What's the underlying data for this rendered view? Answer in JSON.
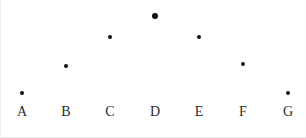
{
  "figure": {
    "width": 306,
    "height": 138,
    "background": "#ffffff",
    "marker_color": "#0d0d0d",
    "label_color": "#2b2b2b"
  },
  "chart_data": {
    "type": "scatter",
    "title": "",
    "subtitle": "",
    "xlabel": "",
    "ylabel": "",
    "categories": [
      "A",
      "B",
      "C",
      "D",
      "E",
      "F",
      "G"
    ],
    "values": [
      1,
      3,
      5,
      6,
      5,
      3,
      1
    ],
    "series": [
      {
        "name": "",
        "values": [
          1,
          3,
          5,
          6,
          5,
          3,
          1
        ]
      }
    ],
    "ylim": [
      0,
      6.5
    ],
    "xlim": [
      0,
      8
    ],
    "grid": false,
    "legend": false,
    "legend_position": "none",
    "annotations": [],
    "points": [
      {
        "label": "A",
        "value": 1,
        "x_px": 22,
        "y_px": 93,
        "size_px": 4
      },
      {
        "label": "B",
        "value": 3,
        "x_px": 66,
        "y_px": 66,
        "size_px": 4
      },
      {
        "label": "C",
        "value": 5,
        "x_px": 110,
        "y_px": 37,
        "size_px": 4
      },
      {
        "label": "D",
        "value": 6,
        "x_px": 155,
        "y_px": 16,
        "size_px": 6
      },
      {
        "label": "E",
        "value": 5,
        "x_px": 199,
        "y_px": 37,
        "size_px": 4
      },
      {
        "label": "F",
        "value": 3,
        "x_px": 243,
        "y_px": 64,
        "size_px": 4
      },
      {
        "label": "G",
        "value": 1,
        "x_px": 288,
        "y_px": 93,
        "size_px": 4
      }
    ],
    "tick_labels": [
      {
        "text": "A",
        "x_px": 22
      },
      {
        "text": "B",
        "x_px": 66
      },
      {
        "text": "C",
        "x_px": 110
      },
      {
        "text": "D",
        "x_px": 155
      },
      {
        "text": "E",
        "x_px": 199
      },
      {
        "text": "F",
        "x_px": 243
      },
      {
        "text": "G",
        "x_px": 288
      }
    ],
    "tick_label_baseline_y_px": 105
  }
}
